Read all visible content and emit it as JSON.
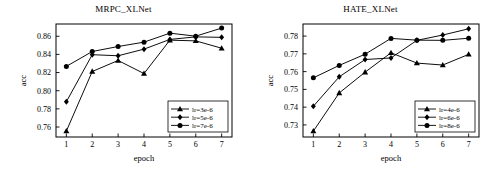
{
  "figure": {
    "panels": [
      "left",
      "right"
    ]
  },
  "chart_data": [
    {
      "type": "line",
      "title": "MRPC_XLNet",
      "xlabel": "epoch",
      "ylabel": "acc",
      "x": [
        1,
        2,
        3,
        4,
        5,
        6,
        7
      ],
      "xlim": [
        0.6,
        7.4
      ],
      "ylim": [
        0.749,
        0.8735
      ],
      "xticks": [
        "1",
        "2",
        "3",
        "4",
        "5",
        "6",
        "7"
      ],
      "yticks": [
        "0.76",
        "0.78",
        "0.80",
        "0.82",
        "0.84",
        "0.86"
      ],
      "ytickvals": [
        0.76,
        0.78,
        0.8,
        0.82,
        0.84,
        0.86
      ],
      "grid": false,
      "legend_position": "lower right",
      "series": [
        {
          "name": "lr=3e-6",
          "marker": "triangle",
          "values": [
            0.7555,
            0.8212,
            0.8333,
            0.8189,
            0.8557,
            0.8549,
            0.8468
          ]
        },
        {
          "name": "lr=5e-6",
          "marker": "diamond",
          "values": [
            0.7878,
            0.8397,
            0.8385,
            0.8458,
            0.8565,
            0.8593,
            0.8588
          ]
        },
        {
          "name": "lr=7e-6",
          "marker": "circle",
          "values": [
            0.8268,
            0.8432,
            0.8487,
            0.8535,
            0.8634,
            0.8601,
            0.869
          ]
        }
      ]
    },
    {
      "type": "line",
      "title": "HATE_XLNet",
      "xlabel": "epoch",
      "ylabel": "acc",
      "x": [
        1,
        2,
        3,
        4,
        5,
        6,
        7
      ],
      "xlim": [
        0.6,
        7.4
      ],
      "ylim": [
        0.7232,
        0.7868
      ],
      "xticks": [
        "1",
        "2",
        "3",
        "4",
        "5",
        "6",
        "7"
      ],
      "yticks": [
        "0.73",
        "0.74",
        "0.75",
        "0.76",
        "0.77",
        "0.78"
      ],
      "ytickvals": [
        0.73,
        0.74,
        0.75,
        0.76,
        0.77,
        0.78
      ],
      "grid": false,
      "legend_position": "lower right",
      "series": [
        {
          "name": "lr=4e-6",
          "marker": "triangle",
          "values": [
            0.7265,
            0.748,
            0.7597,
            0.7706,
            0.7648,
            0.7637,
            0.7697
          ]
        },
        {
          "name": "lr=6e-6",
          "marker": "diamond",
          "values": [
            0.7405,
            0.7571,
            0.7668,
            0.7677,
            0.7776,
            0.7806,
            0.7841
          ]
        },
        {
          "name": "lr=8e-6",
          "marker": "circle",
          "values": [
            0.7565,
            0.7635,
            0.7698,
            0.7787,
            0.7777,
            0.7776,
            0.7788
          ]
        }
      ]
    }
  ]
}
